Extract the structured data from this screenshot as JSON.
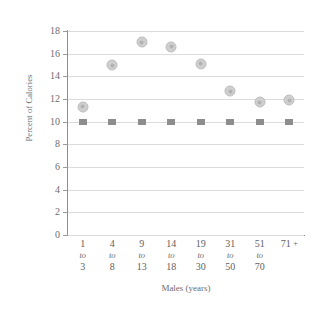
{
  "chart_data": {
    "type": "scatter",
    "title": "",
    "xlabel": "Males (years)",
    "ylabel": "Percent of Calories",
    "categories": [
      "1 to 3",
      "4 to 8",
      "9 to 13",
      "14 to 18",
      "19 to 30",
      "31 to 50",
      "51 to 70",
      "71 +"
    ],
    "category_parts": [
      {
        "top": "1",
        "mid": "to",
        "bottom": "3"
      },
      {
        "top": "4",
        "mid": "to",
        "bottom": "8"
      },
      {
        "top": "9",
        "mid": "to",
        "bottom": "13"
      },
      {
        "top": "14",
        "mid": "to",
        "bottom": "18"
      },
      {
        "top": "19",
        "mid": "to",
        "bottom": "30"
      },
      {
        "top": "31",
        "mid": "to",
        "bottom": "50"
      },
      {
        "top": "51",
        "mid": "to",
        "bottom": "70"
      },
      {
        "top": "71 +",
        "mid": "",
        "bottom": ""
      }
    ],
    "series": [
      {
        "name": "Actual intake",
        "marker": "circle",
        "color": "#cfcfcf",
        "values": [
          11.3,
          15.0,
          17.0,
          16.6,
          15.1,
          12.7,
          11.7,
          11.9
        ]
      },
      {
        "name": "Recommended limit",
        "marker": "square",
        "color": "#8d8d8d",
        "values": [
          10,
          10,
          10,
          10,
          10,
          10,
          10,
          10
        ]
      }
    ],
    "ylim": [
      0,
      18
    ],
    "ytick_step": 2,
    "ytick_labels": [
      "18",
      "16",
      "14",
      "12",
      "10",
      "8",
      "6",
      "4",
      "2",
      "0"
    ],
    "grid": true,
    "legend": "none"
  }
}
